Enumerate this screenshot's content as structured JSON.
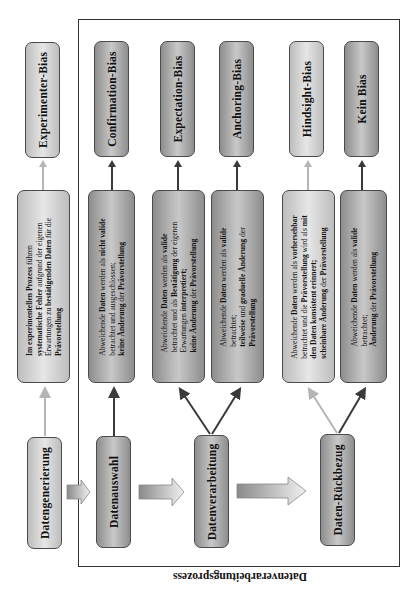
{
  "frame_label": "Datenverarbeitungsprozess",
  "bias_boxes": [
    {
      "label": "Experimenter-Bias"
    },
    {
      "label": "Confirmation-Bias"
    },
    {
      "label": "Expectation-Bias"
    },
    {
      "label": "Anchoring-Bias"
    },
    {
      "label": "Hindsight-Bias"
    },
    {
      "label": "Kein Bias"
    }
  ],
  "descriptions": [
    {
      "lines": [
        [
          {
            "t": "Im ",
            "b": true
          },
          {
            "t": "experimentellen Prozess",
            "b": true
          },
          {
            "t": " führen",
            "b": false
          }
        ],
        [
          {
            "t": "systematische Fehler",
            "b": true
          },
          {
            "t": " aufgrund der eigenen",
            "b": false
          }
        ],
        [
          {
            "t": "Erwartungen zu ",
            "b": false
          },
          {
            "t": "bestätigenden Daten",
            "b": true
          },
          {
            "t": " für die",
            "b": false
          }
        ],
        [
          {
            "t": "Prävorstellung",
            "b": true
          }
        ]
      ]
    },
    {
      "lines": [
        [
          {
            "t": "Abweichende ",
            "b": false
          },
          {
            "t": "Daten",
            "b": true
          },
          {
            "t": " werden als ",
            "b": false
          },
          {
            "t": "nicht valide",
            "b": true
          }
        ],
        [
          {
            "t": "betrachtet und ausgeschlossen;",
            "b": false
          }
        ],
        [
          {
            "t": "keine Änderung",
            "b": true
          },
          {
            "t": " der ",
            "b": false
          },
          {
            "t": "Prävorstellung",
            "b": true
          }
        ]
      ]
    },
    {
      "lines": [
        [
          {
            "t": "Abweichende ",
            "b": false
          },
          {
            "t": "Daten",
            "b": true
          },
          {
            "t": " werden als ",
            "b": false
          },
          {
            "t": "valide",
            "b": true
          }
        ],
        [
          {
            "t": "betrachtet und als ",
            "b": false
          },
          {
            "t": "Bestätigung",
            "b": true
          },
          {
            "t": " der eigenen",
            "b": false
          }
        ],
        [
          {
            "t": "Erwartungen  ",
            "b": false
          },
          {
            "t": "interpretiert;",
            "b": true
          }
        ],
        [
          {
            "t": "keine Änderung",
            "b": true
          },
          {
            "t": " der ",
            "b": false
          },
          {
            "t": "Prävorstellung",
            "b": true
          }
        ]
      ]
    },
    {
      "lines": [
        [
          {
            "t": "Abweichende ",
            "b": false
          },
          {
            "t": "Daten",
            "b": true
          },
          {
            "t": " werden als ",
            "b": false
          },
          {
            "t": "valide",
            "b": true
          }
        ],
        [
          {
            "t": "betrachtet;",
            "b": false
          }
        ],
        [
          {
            "t": "teilweise",
            "b": true
          },
          {
            "t": " und ",
            "b": false
          },
          {
            "t": "graduelle Änderung",
            "b": true
          },
          {
            "t": "  der",
            "b": false
          }
        ],
        [
          {
            "t": "Prävorstellung",
            "b": true
          }
        ]
      ]
    },
    {
      "lines": [
        [
          {
            "t": "Abweichende ",
            "b": false
          },
          {
            "t": "Daten",
            "b": true
          },
          {
            "t": " werden als ",
            "b": false
          },
          {
            "t": "vorhersehbar",
            "b": true
          }
        ],
        [
          {
            "t": "betrachtet und die ",
            "b": false
          },
          {
            "t": "Prävorstellung",
            "b": true
          },
          {
            "t": " wird als ",
            "b": false
          },
          {
            "t": "mit",
            "b": true
          }
        ],
        [
          {
            "t": "den Daten konsistent erinnert;",
            "b": true
          }
        ],
        [
          {
            "t": "scheinbare Änderung",
            "b": true
          },
          {
            "t": " der ",
            "b": false
          },
          {
            "t": "Prävorstellung",
            "b": true
          }
        ]
      ]
    },
    {
      "lines": [
        [
          {
            "t": "Abweichende ",
            "b": false
          },
          {
            "t": "Daten",
            "b": true
          },
          {
            "t": " werden als ",
            "b": false
          },
          {
            "t": "valide",
            "b": true
          }
        ],
        [
          {
            "t": "betrachtet;",
            "b": false
          }
        ],
        [
          {
            "t": "Änderung",
            "b": true
          },
          {
            "t": " der ",
            "b": false
          },
          {
            "t": "Prävorstellung",
            "b": true
          }
        ]
      ]
    }
  ],
  "process_steps": [
    {
      "label": "Datengenerierung"
    },
    {
      "label": "Datenauswahl"
    },
    {
      "label": "Datenverarbeitung"
    },
    {
      "label": "Daten-Rückbezug"
    }
  ],
  "colors": {
    "dark_box": "#a8a8a8",
    "light_box": "#d6d6d6",
    "dark_arrow": "#3a3a3a",
    "light_arrow": "#b5b5b5",
    "frame": "#333333"
  }
}
